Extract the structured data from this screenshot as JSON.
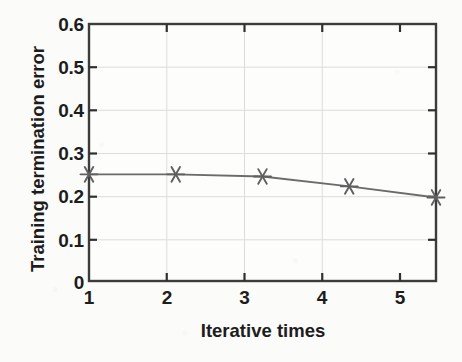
{
  "chart_data": {
    "type": "line",
    "title": "",
    "xlabel": "Iterative times",
    "ylabel": "Training termination error",
    "x": [
      1,
      2,
      3,
      4,
      5
    ],
    "values": [
      0.249,
      0.249,
      0.244,
      0.221,
      0.195
    ],
    "series": [
      {
        "name": "Training termination error",
        "values": [
          0.249,
          0.249,
          0.244,
          0.221,
          0.195
        ]
      }
    ],
    "xlim": [
      1,
      5
    ],
    "ylim": [
      0,
      0.6
    ],
    "xticks": [
      "1",
      "2",
      "3",
      "4",
      "5"
    ],
    "yticks": [
      "0",
      "0.1",
      "0.2",
      "0.3",
      "0.4",
      "0.5",
      "0.6"
    ],
    "grid": true,
    "legend": null,
    "marker": "asterisk",
    "line_color": "#6b6b6b",
    "marker_color": "#5f5f5f",
    "axis_color": "#3c3c3c",
    "grid_color": "#d8d8d8",
    "background_color": "#fbfbf9"
  },
  "axes": {
    "y_tick_labels": [
      {
        "text": "0.6",
        "value": 0.6
      },
      {
        "text": "0.5",
        "value": 0.5
      },
      {
        "text": "0.4",
        "value": 0.4
      },
      {
        "text": "0.3",
        "value": 0.3
      },
      {
        "text": "0.2",
        "value": 0.2
      },
      {
        "text": "0.1",
        "value": 0.1
      },
      {
        "text": "0",
        "value": 0.0
      }
    ],
    "x_tick_labels": [
      {
        "text": "1",
        "value": 1
      },
      {
        "text": "2",
        "value": 2
      },
      {
        "text": "3",
        "value": 3
      },
      {
        "text": "4",
        "value": 4
      },
      {
        "text": "5",
        "value": 5
      }
    ],
    "y_axis_title": "Training termination error",
    "x_axis_title": "Iterative times"
  }
}
